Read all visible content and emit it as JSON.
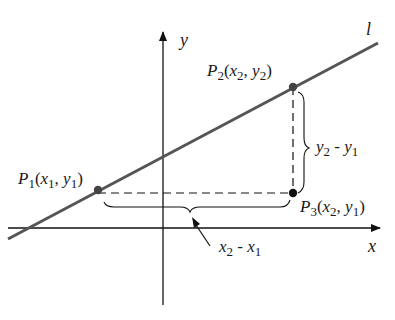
{
  "diagram": {
    "axes": {
      "x_label": "x",
      "y_label": "y"
    },
    "line": {
      "label": "l",
      "color": "#555555"
    },
    "points": [
      {
        "name": "P",
        "sub": "1",
        "coords_open": "(",
        "x": "x",
        "xs": "1",
        "sep": ", ",
        "y": "y",
        "ys": "1",
        "coords_close": ")"
      },
      {
        "name": "P",
        "sub": "2",
        "coords_open": "(",
        "x": "x",
        "xs": "2",
        "sep": ", ",
        "y": "y",
        "ys": "2",
        "coords_close": ")"
      },
      {
        "name": "P",
        "sub": "3",
        "coords_open": "(",
        "x": "x",
        "xs": "2",
        "sep": ", ",
        "y": "y",
        "ys": "1",
        "coords_close": ")"
      }
    ],
    "rise_label": {
      "a": "y",
      "as": "2",
      "op": " - ",
      "b": "y",
      "bs": "1"
    },
    "run_label": {
      "a": "x",
      "as": "2",
      "op": " - ",
      "b": "x",
      "bs": "1"
    }
  }
}
